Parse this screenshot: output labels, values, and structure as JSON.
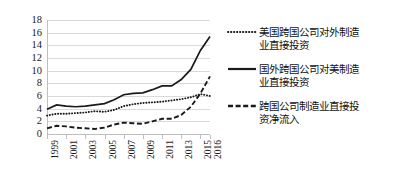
{
  "chart_data": {
    "type": "line",
    "title": "",
    "xlabel": "",
    "ylabel": "",
    "ylim": [
      0,
      18
    ],
    "ytick_step": 2,
    "yticks": [
      "0",
      "2",
      "4",
      "6",
      "8",
      "10",
      "12",
      "14",
      "16",
      "18"
    ],
    "grid": true,
    "grid_axis": "y",
    "legend_position": "right",
    "x": [
      1999,
      2000,
      2001,
      2002,
      2003,
      2004,
      2005,
      2006,
      2007,
      2008,
      2009,
      2010,
      2011,
      2012,
      2013,
      2014,
      2015,
      2016
    ],
    "xtick_labels": [
      "1999",
      "2001",
      "2003",
      "2005",
      "2007",
      "2009",
      "2011",
      "2013",
      "2015",
      "2016"
    ],
    "xtick_values": [
      1999,
      2001,
      2003,
      2005,
      2007,
      2009,
      2011,
      2013,
      2015,
      2016
    ],
    "series": [
      {
        "name": "美国跨国公司对外制造业直接投资",
        "style": "dotted",
        "color": "#1a1a1a",
        "values": [
          2.9,
          3.2,
          3.2,
          3.3,
          3.4,
          3.6,
          3.5,
          3.8,
          4.4,
          4.7,
          4.9,
          5.0,
          5.1,
          5.3,
          5.5,
          5.8,
          6.3,
          6.0
        ]
      },
      {
        "name": "国外跨国公司对美制造业直接投资",
        "style": "solid",
        "color": "#1a1a1a",
        "values": [
          3.9,
          4.6,
          4.4,
          4.3,
          4.4,
          4.6,
          4.8,
          5.4,
          6.2,
          6.4,
          6.5,
          7.0,
          7.6,
          7.6,
          8.6,
          10.2,
          13.2,
          15.4
        ]
      },
      {
        "name": "跨国公司制造业直接投资净流入",
        "style": "dashed",
        "color": "#1a1a1a",
        "values": [
          0.9,
          1.3,
          1.2,
          1.0,
          0.9,
          0.8,
          1.0,
          1.5,
          1.8,
          1.7,
          1.6,
          2.0,
          2.4,
          2.4,
          3.0,
          4.3,
          6.4,
          9.1
        ]
      }
    ]
  },
  "legend": {
    "items": [
      {
        "label": "美国跨国公司对外制造业直接投资",
        "style": "dotted"
      },
      {
        "label": "国外跨国公司对美制造业直接投资",
        "style": "solid"
      },
      {
        "label": "跨国公司制造业直接投资净流入",
        "style": "dashed"
      }
    ]
  }
}
